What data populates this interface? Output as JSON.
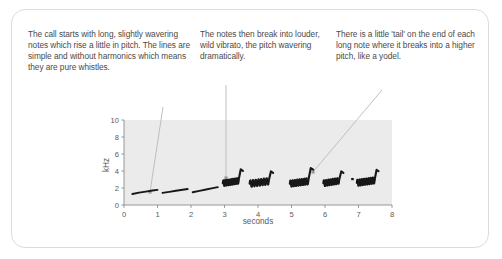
{
  "figure": {
    "frame_color": "#dcdcdc",
    "background": "#ffffff"
  },
  "annotations": [
    {
      "id": "annot-1",
      "text": "The call starts with long, slightly wavering notes which rise a little in pitch. The lines are simple and without harmonics which means they are pure whistles.",
      "leader": {
        "from_x": 163,
        "from_y": 107,
        "to_x": 150,
        "to_y": 192,
        "marker": "square-dot"
      }
    },
    {
      "id": "annot-2",
      "text": "The notes then break into louder, wild vibrato, the pitch wavering dramatically.",
      "leader": {
        "from_x": 226,
        "from_y": 85,
        "to_x": 226,
        "to_y": 178,
        "marker": "square-dot"
      }
    },
    {
      "id": "annot-3",
      "text": "There is a little 'tail' on the end of each long note where it breaks into a higher pitch, like a yodel.",
      "leader": {
        "from_x": 382,
        "from_y": 90,
        "to_x": 313,
        "to_y": 172,
        "marker": "square-dot"
      }
    }
  ],
  "chart_data": {
    "type": "line",
    "title": "",
    "subtitle": "",
    "xlabel": "seconds",
    "ylabel": "kHz",
    "xlim": [
      0,
      8
    ],
    "ylim": [
      0,
      10
    ],
    "xticks": [
      0,
      1,
      2,
      3,
      4,
      5,
      6,
      7,
      8
    ],
    "xtick_labels": [
      "0",
      "1",
      "2",
      "3",
      "4",
      "5",
      "6",
      "7",
      "8"
    ],
    "yticks": [
      0,
      2,
      4,
      6,
      8,
      10
    ],
    "ytick_labels": [
      "0",
      "2",
      "4",
      "6",
      "8",
      "10"
    ],
    "grid": false,
    "legend": "none",
    "plot_background": "#ebebeb",
    "trace_color": "#171717",
    "axis_color": "#888888",
    "series": [
      {
        "name": "whistle-1",
        "style": "smooth-rise",
        "x": [
          0.25,
          0.45,
          0.65,
          0.85,
          1.0
        ],
        "y": [
          1.3,
          1.45,
          1.58,
          1.7,
          1.78
        ]
      },
      {
        "name": "whistle-2",
        "style": "smooth-rise",
        "x": [
          1.15,
          1.35,
          1.55,
          1.75,
          1.9
        ],
        "y": [
          1.42,
          1.55,
          1.68,
          1.8,
          1.88
        ]
      },
      {
        "name": "whistle-3",
        "style": "smooth-rise",
        "x": [
          2.05,
          2.25,
          2.45,
          2.65,
          2.8
        ],
        "y": [
          1.5,
          1.66,
          1.82,
          1.98,
          2.1
        ]
      },
      {
        "name": "vibrato-note-1",
        "style": "vibrato-with-tail",
        "x_start": 2.95,
        "x_end": 3.55,
        "base_y": 2.55,
        "vibrato_amplitude": 0.35,
        "cycles": 8,
        "tail_x": 3.42,
        "tail_y_low": 2.9,
        "tail_y_high": 4.2
      },
      {
        "name": "vibrato-note-2",
        "style": "vibrato-with-tail",
        "x_start": 3.75,
        "x_end": 4.45,
        "base_y": 2.5,
        "vibrato_amplitude": 0.4,
        "cycles": 7,
        "tail_x": 4.32,
        "tail_y_low": 2.85,
        "tail_y_high": 3.95
      },
      {
        "name": "vibrato-note-3",
        "style": "vibrato-with-tail",
        "x_start": 4.95,
        "x_end": 5.65,
        "base_y": 2.5,
        "vibrato_amplitude": 0.38,
        "cycles": 8,
        "tail_x": 5.5,
        "tail_y_low": 2.85,
        "tail_y_high": 4.35
      },
      {
        "name": "vibrato-note-4",
        "style": "vibrato-with-tail",
        "x_start": 5.95,
        "x_end": 6.55,
        "base_y": 2.55,
        "vibrato_amplitude": 0.36,
        "cycles": 7,
        "tail_x": 6.42,
        "tail_y_low": 2.9,
        "tail_y_high": 3.95
      },
      {
        "name": "vibrato-note-5",
        "style": "vibrato-with-tail",
        "x_start": 6.95,
        "x_end": 7.6,
        "base_y": 2.6,
        "vibrato_amplitude": 0.38,
        "cycles": 8,
        "tail_x": 7.48,
        "tail_y_low": 2.95,
        "tail_y_high": 4.15
      },
      {
        "name": "short-blip",
        "style": "dot",
        "x": [
          6.82
        ],
        "y": [
          3.05
        ]
      }
    ]
  }
}
